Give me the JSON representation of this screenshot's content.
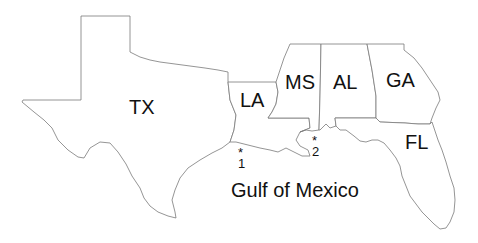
{
  "map": {
    "region": "US Gulf Coast",
    "states": [
      {
        "abbr": "TX",
        "name": "Texas"
      },
      {
        "abbr": "LA",
        "name": "Louisiana"
      },
      {
        "abbr": "MS",
        "name": "Mississippi"
      },
      {
        "abbr": "AL",
        "name": "Alabama"
      },
      {
        "abbr": "GA",
        "name": "Georgia"
      },
      {
        "abbr": "FL",
        "name": "Florida"
      }
    ],
    "water_body": "Gulf of Mexico",
    "sites": [
      {
        "marker": "*",
        "label": "1"
      },
      {
        "marker": "*",
        "label": "2"
      }
    ],
    "colors": {
      "background": "#ffffff",
      "border": "#7a7a7a",
      "text": "#111111"
    }
  }
}
